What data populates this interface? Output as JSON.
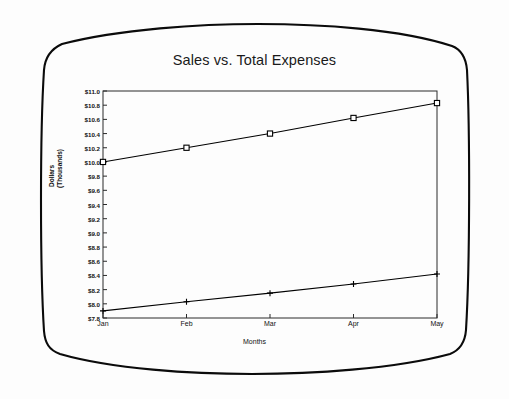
{
  "chart_data": {
    "type": "line",
    "title": "Sales vs. Total Expenses",
    "xlabel": "Months",
    "ylabel": "Dollars (Thousands)",
    "ylabel_line1": "Dollars",
    "ylabel_line2": "(Thousands)",
    "categories": [
      "Jan",
      "Feb",
      "Mar",
      "Apr",
      "May"
    ],
    "x": [
      1,
      2,
      3,
      4,
      5
    ],
    "ylim": [
      7.8,
      11.0
    ],
    "ytick_step": 0.2,
    "ytick_labels": [
      "$11.0",
      "$10.8",
      "$10.6",
      "$10.4",
      "$10.2",
      "$10.0",
      "$9.8",
      "$9.6",
      "$9.4",
      "$9.2",
      "$9.0",
      "$8.8",
      "$8.6",
      "$8.4",
      "$8.2",
      "$8.0",
      "$7.8"
    ],
    "ytick_values": [
      11.0,
      10.8,
      10.6,
      10.4,
      10.2,
      10.0,
      9.8,
      9.6,
      9.4,
      9.2,
      9.0,
      8.8,
      8.6,
      8.4,
      8.2,
      8.0,
      7.8
    ],
    "grid": false,
    "legend": "none",
    "series": [
      {
        "name": "Sales",
        "marker": "square",
        "color": "#000000",
        "values": [
          10.0,
          10.2,
          10.4,
          10.62,
          10.83
        ]
      },
      {
        "name": "Total Expenses",
        "marker": "plus",
        "color": "#000000",
        "values": [
          7.9,
          8.03,
          8.15,
          8.28,
          8.42
        ]
      }
    ]
  },
  "frame": {
    "border_color": "#000000",
    "plot_border_color": "#222222",
    "background": "#fdfdfd"
  }
}
